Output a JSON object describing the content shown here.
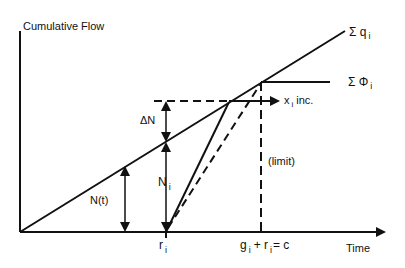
{
  "diagram": {
    "y_axis_label": "Cumulative Flow",
    "x_axis_label": "Time",
    "labels": {
      "sum_q": "Σ q",
      "sum_q_sub": "i",
      "sum_phi": "Σ Φ",
      "sum_phi_sub": "i",
      "x_inc": "x",
      "x_inc_sub": "i",
      "x_inc_suffix": "inc.",
      "delta_n": "ΔN",
      "n_i": "N",
      "n_i_sub": "i",
      "n_t": "N(t)",
      "limit": "(limit)",
      "r_i": "r",
      "r_i_sub": "i",
      "cycle_g": "g",
      "cycle_g_sub": "i",
      "cycle_plus_r": "+ r",
      "cycle_r_sub": "i",
      "cycle_eq": "= c"
    },
    "colors": {
      "ink": "#111111",
      "background": "#ffffff"
    }
  }
}
